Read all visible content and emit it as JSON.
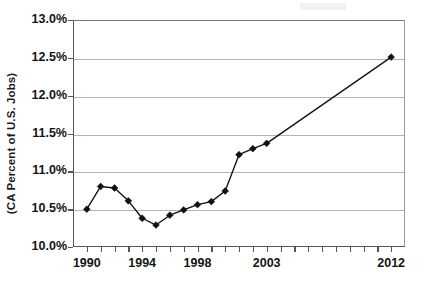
{
  "chart_data": {
    "type": "line",
    "title": "",
    "subtitle": "",
    "xlabel": "",
    "ylabel": "(CA Percent of U.S. Jobs)",
    "legend": [],
    "legend_position": "none",
    "grid": true,
    "grid_axis": "y",
    "xlim": [
      1989.0,
      2013.0
    ],
    "ylim": [
      10.0,
      13.0
    ],
    "ytick_values": [
      10.0,
      10.5,
      11.0,
      11.5,
      12.0,
      12.5,
      13.0
    ],
    "ytick_labels": [
      "10.0%",
      "10.5%",
      "11.0%",
      "11.5%",
      "12.0%",
      "12.5%",
      "13.0%"
    ],
    "xtick_values": [
      1990,
      1994,
      1998,
      2003,
      2012
    ],
    "xtick_labels": [
      "1990",
      "1994",
      "1998",
      "2003",
      "2012"
    ],
    "xtick_minor_values": [
      1991,
      1992,
      1993,
      1995,
      1996,
      1997,
      1999,
      2000,
      2001,
      2002,
      2004,
      2005,
      2006,
      2007,
      2008,
      2009,
      2010,
      2011
    ],
    "marker_shape": "diamond",
    "series": [
      {
        "name": "CA Percent of U.S. Jobs",
        "color": "#111111",
        "x": [
          1990,
          1991,
          1992,
          1993,
          1994,
          1995,
          1996,
          1997,
          1998,
          1999,
          2000,
          2001,
          2002,
          2003,
          2012
        ],
        "values": [
          10.5,
          10.8,
          10.78,
          10.61,
          10.38,
          10.29,
          10.42,
          10.49,
          10.56,
          10.6,
          10.74,
          11.22,
          11.3,
          11.37,
          12.51
        ]
      }
    ]
  },
  "axis": {
    "y_title": "(CA Percent of U.S. Jobs)"
  }
}
